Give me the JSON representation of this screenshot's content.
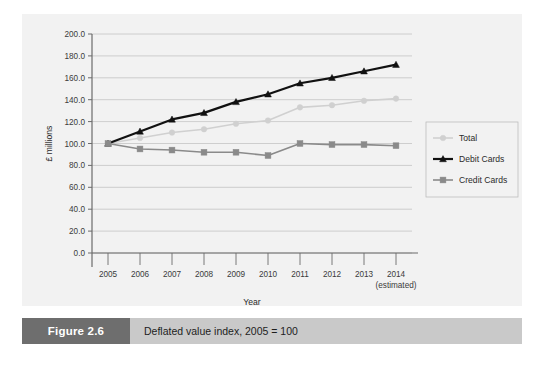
{
  "figure": {
    "number_label": "Figure 2.6",
    "caption": "Deflated value index, 2005 = 100"
  },
  "chart_data": {
    "type": "line",
    "title": "",
    "xlabel": "Year",
    "ylabel": "£ millions",
    "categories": [
      "2005",
      "2006",
      "2007",
      "2008",
      "2009",
      "2010",
      "2011",
      "2012",
      "2013",
      "2014"
    ],
    "x_note": "(estimated)",
    "x_note_category": "2014",
    "ylim": [
      0,
      200
    ],
    "ytick_step": 20,
    "ytick_labels": [
      "0.0",
      "20.0",
      "40.0",
      "60.0",
      "80.0",
      "100.0",
      "120.0",
      "140.0",
      "160.0",
      "180.0",
      "200.0"
    ],
    "grid": true,
    "legend_position": "right",
    "series": [
      {
        "name": "Total",
        "color": "#d0d0d0",
        "marker": "circle",
        "values": [
          100,
          105,
          110,
          113,
          118,
          121,
          133,
          135,
          139,
          141
        ]
      },
      {
        "name": "Debit Cards",
        "color": "#111111",
        "marker": "triangle",
        "values": [
          100,
          111,
          122,
          128,
          138,
          145,
          155,
          160,
          166,
          172
        ]
      },
      {
        "name": "Credit Cards",
        "color": "#8a8a8a",
        "marker": "square",
        "values": [
          100,
          95,
          94,
          92,
          92,
          89,
          100,
          99,
          99,
          98
        ]
      }
    ]
  },
  "colors": {
    "panel_background": "#f2f2f2",
    "gridline": "#c4c4c4",
    "axis": "#6b6b6b",
    "caption_bar": "#c9c9c9",
    "figure_box": "#6e6e6e"
  }
}
